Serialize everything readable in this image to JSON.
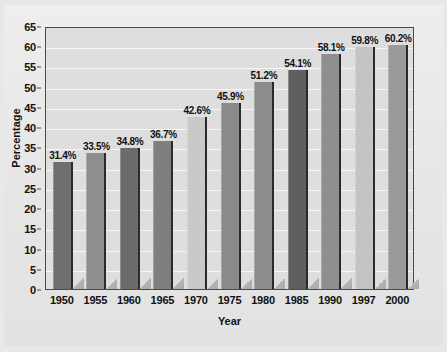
{
  "chart_data": {
    "type": "bar",
    "title": "",
    "xlabel": "Year",
    "ylabel": "Percentage",
    "categories": [
      "1950",
      "1955",
      "1960",
      "1965",
      "1970",
      "1975",
      "1980",
      "1985",
      "1990",
      "1997",
      "2000"
    ],
    "values": [
      31.4,
      33.5,
      34.8,
      36.7,
      42.6,
      45.9,
      51.2,
      54.1,
      58.1,
      59.8,
      60.2
    ],
    "data_labels": [
      "31.4%",
      "33.5%",
      "34.8%",
      "36.7%",
      "42.6%",
      "45.9%",
      "51.2%",
      "54.1%",
      "58.1%",
      "59.8%",
      "60.2%"
    ],
    "bar_colors": [
      "#6e6e6e",
      "#8e8e8e",
      "#6b6b6b",
      "#7e7e7e",
      "#c9c9c9",
      "#8a8a8a",
      "#8c8c8c",
      "#5f5f5f",
      "#8f8f8f",
      "#c4c4c4",
      "#9a9a9a"
    ],
    "ylim": [
      0,
      65
    ],
    "ytick_step": 5,
    "ytick_labels": [
      "0",
      "5",
      "10",
      "15",
      "20",
      "25",
      "30",
      "35",
      "40",
      "45",
      "50",
      "55",
      "60",
      "65"
    ],
    "grid": true,
    "grid_axis": "y",
    "grid_color": "#f7f7f7",
    "legend": "none",
    "plot_background": "#dedede",
    "figure_background": "#e8e8e8",
    "axis_border_color": "#4a4a4a",
    "text_color": "#111111"
  }
}
